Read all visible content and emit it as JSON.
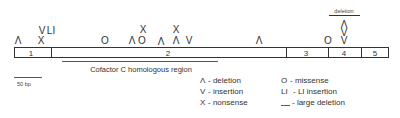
{
  "figure": {
    "exons": [
      {
        "label": "1"
      },
      {
        "label": "2"
      },
      {
        "label": "3"
      },
      {
        "label": "4"
      },
      {
        "label": "5"
      }
    ],
    "mutations": [
      {
        "symbol": "Λ",
        "type": "deletion",
        "exon": "1"
      },
      {
        "symbol": "X",
        "type": "nonsense",
        "exon": "1"
      },
      {
        "symbol": "V",
        "type": "insertion",
        "exon": "1"
      },
      {
        "symbol": "LI",
        "type": "LI insertion",
        "exon": "1"
      },
      {
        "symbol": "O",
        "type": "missense",
        "exon": "2"
      },
      {
        "symbol": "Λ",
        "type": "deletion",
        "exon": "2"
      },
      {
        "symbol": "O",
        "type": "missense",
        "exon": "2"
      },
      {
        "symbol": "X",
        "type": "nonsense",
        "exon": "2"
      },
      {
        "symbol": "Λ",
        "type": "deletion",
        "exon": "2"
      },
      {
        "symbol": "Λ",
        "type": "deletion",
        "exon": "2"
      },
      {
        "symbol": "X",
        "type": "nonsense",
        "exon": "2"
      },
      {
        "symbol": "V",
        "type": "insertion",
        "exon": "2"
      },
      {
        "symbol": "Λ",
        "type": "deletion",
        "exon": "2"
      },
      {
        "symbol": "O",
        "type": "missense",
        "exon": "4"
      },
      {
        "symbol": "V",
        "type": "insertion",
        "exon": "4"
      },
      {
        "symbol": "V",
        "type": "insertion",
        "exon": "4"
      },
      {
        "symbol": "Λ",
        "type": "deletion",
        "exon": "4"
      }
    ],
    "large_deletion_label": "deletion",
    "cofactor_region_label": "Cofactor C homologous region",
    "scale_bar_label": "50 bp",
    "legend": [
      {
        "symbol": "Λ",
        "text": "- deletion"
      },
      {
        "symbol": "V",
        "text": "- insertion"
      },
      {
        "symbol": "X",
        "text": "- nonsense"
      },
      {
        "symbol": "O",
        "text": "- missense"
      },
      {
        "symbol": "LI",
        "text": "- LI insertion"
      },
      {
        "symbol": "__",
        "text": "- large deletion"
      }
    ],
    "colors": {
      "ink": "#333333",
      "background": "#ffffff"
    }
  }
}
